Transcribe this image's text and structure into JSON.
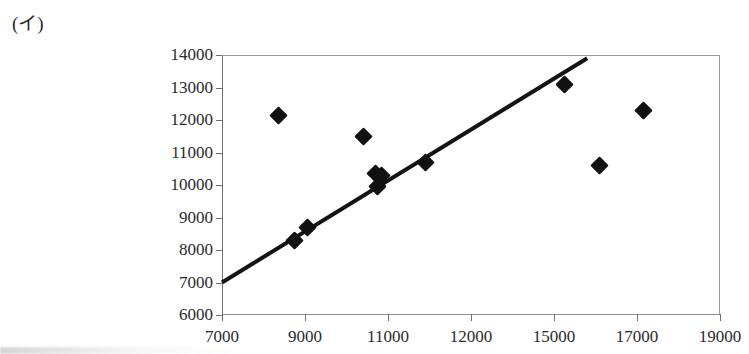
{
  "figure": {
    "label": "(イ)"
  },
  "chart_data": {
    "type": "scatter",
    "title": "",
    "xlabel": "",
    "ylabel": "",
    "xlim": [
      7000,
      19000
    ],
    "ylim": [
      6000,
      14000
    ],
    "grid": false,
    "legend": false,
    "x_tick_labels": [
      "7000",
      "9000",
      "11000",
      "12000",
      "15000",
      "17000",
      "19000"
    ],
    "y_tick_labels": [
      "14000",
      "13000",
      "12000",
      "11000",
      "10000",
      "9000",
      "8000",
      "7000",
      "6000"
    ],
    "x_tick_values": [
      7000,
      9000,
      11000,
      12000,
      15000,
      17000,
      19000
    ],
    "y_tick_values": [
      14000,
      13000,
      12000,
      11000,
      10000,
      9000,
      8000,
      7000,
      6000
    ],
    "marker": "diamond",
    "marker_color": "#111111",
    "points": [
      {
        "x": 8350,
        "y": 12150
      },
      {
        "x": 8750,
        "y": 8300
      },
      {
        "x": 9050,
        "y": 8700
      },
      {
        "x": 10400,
        "y": 11500
      },
      {
        "x": 10700,
        "y": 10350
      },
      {
        "x": 10850,
        "y": 10300
      },
      {
        "x": 10750,
        "y": 9950
      },
      {
        "x": 11450,
        "y": 10700
      },
      {
        "x": 15250,
        "y": 13100
      },
      {
        "x": 16100,
        "y": 10600
      },
      {
        "x": 17150,
        "y": 12300
      }
    ],
    "trend_line": {
      "type": "line",
      "color": "#141414",
      "width_px": 4,
      "start": {
        "x": 7000,
        "y": 7000
      },
      "end": {
        "x": 15800,
        "y": 13900
      }
    }
  }
}
